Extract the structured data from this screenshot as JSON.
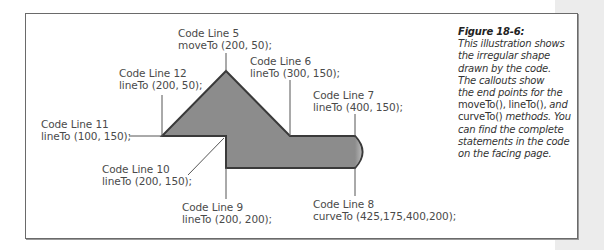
{
  "figure": {
    "title": "Figure 18-6:",
    "caption_lines": [
      "This illustration shows",
      "the irregular shape",
      "drawn by the code.",
      "The callouts show",
      "the end points for the"
    ],
    "caption_mixed": {
      "a": "moveTo(), lineTo(),",
      "b": " and",
      "c": "curveTo()",
      "d": " methods. You"
    },
    "caption_tail": [
      "can find the complete",
      "statements in the code",
      "on the facing page."
    ]
  },
  "callouts": [
    {
      "id": "line5",
      "label": "Code Line 5",
      "code": "moveTo (200, 50);"
    },
    {
      "id": "line6",
      "label": "Code Line 6",
      "code": "lineTo (300, 150);"
    },
    {
      "id": "line7",
      "label": "Code Line 7",
      "code": "lineTo (400, 150);"
    },
    {
      "id": "line8",
      "label": "Code Line 8",
      "code": "curveTo (425,175,400,200);"
    },
    {
      "id": "line9",
      "label": "Code Line 9",
      "code": "lineTo (200, 200);"
    },
    {
      "id": "line10",
      "label": "Code Line 10",
      "code": "lineTo (200, 150);"
    },
    {
      "id": "line11",
      "label": "Code Line 11",
      "code": "lineTo (100, 150);"
    },
    {
      "id": "line12",
      "label": "Code Line 12",
      "code": "lineTo (200, 50);"
    }
  ],
  "colors": {
    "shape_fill": "#8c8c8c",
    "shape_stroke": "#3a3a3a",
    "leader": "#555555",
    "frame": "#6a6a6a",
    "side_strip": "#ececec"
  }
}
